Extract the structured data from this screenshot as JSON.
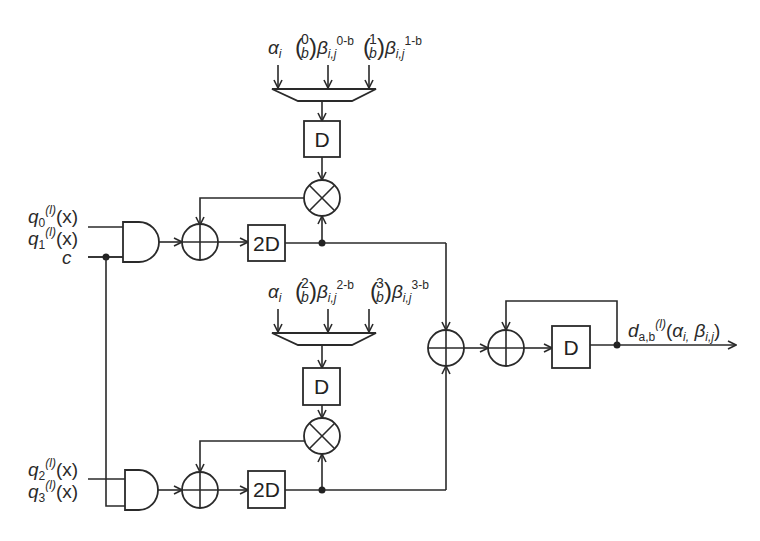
{
  "diagram": {
    "type": "hardware-block-diagram",
    "top_branch": {
      "inputs": {
        "q0": {
          "sym": "q",
          "sub": "0",
          "sup": "(l)",
          "arg": "(x)"
        },
        "q1": {
          "sym": "q",
          "sub": "1",
          "sup": "(l)",
          "arg": "(x)"
        },
        "c": "c"
      },
      "mux_inputs": [
        {
          "label": "α",
          "sub": "i"
        },
        {
          "binom_top": "0",
          "binom_bot": "b",
          "beta": "β",
          "beta_sub": "i,j",
          "exp": "0-b"
        },
        {
          "binom_top": "1",
          "binom_bot": "b",
          "beta": "β",
          "beta_sub": "i,j",
          "exp": "1-b"
        }
      ],
      "delay_label": "D",
      "delay2_label": "2D"
    },
    "bottom_branch": {
      "inputs": {
        "q2": {
          "sym": "q",
          "sub": "2",
          "sup": "(l)",
          "arg": "(x)"
        },
        "q3": {
          "sym": "q",
          "sub": "3",
          "sup": "(l)",
          "arg": "(x)"
        }
      },
      "mux_inputs": [
        {
          "label": "α",
          "sub": "i"
        },
        {
          "binom_top": "2",
          "binom_bot": "b",
          "beta": "β",
          "beta_sub": "i,j",
          "exp": "2-b"
        },
        {
          "binom_top": "3",
          "binom_bot": "b",
          "beta": "β",
          "beta_sub": "i,j",
          "exp": "3-b"
        }
      ],
      "delay_label": "D",
      "delay2_label": "2D"
    },
    "output_stage": {
      "delay_label": "D",
      "output": {
        "sym": "d",
        "sub": "a,b",
        "sup": "(l)",
        "args_open": "(",
        "alpha": "α",
        "alpha_sub": "i,",
        "beta": " β",
        "beta_sub": "i,j",
        "args_close": ")"
      }
    },
    "colors": {
      "line": "#2a2a2a",
      "background": "#ffffff"
    }
  }
}
